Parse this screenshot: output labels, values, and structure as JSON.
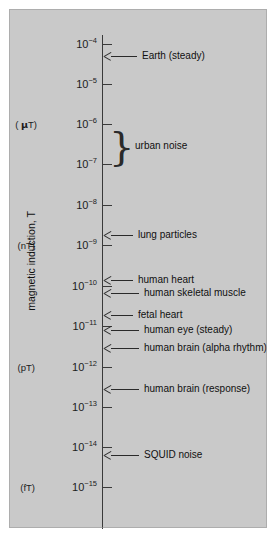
{
  "figure": {
    "background_color": "#c9c9c9",
    "axis_color": "#3a3a3a",
    "text_color": "#101010",
    "y_axis_title": "magnetic induction, T"
  },
  "chart_data": {
    "type": "scatter",
    "title": "",
    "xlabel": "",
    "ylabel": "magnetic induction, T",
    "scale": "log",
    "ylim": [
      1e-15,
      0.0001
    ],
    "grid": false,
    "legend": "none",
    "tick_labels": [
      {
        "exponent": "-4",
        "mantissa": "10",
        "prefix": "",
        "value": 0.0001,
        "y": 35
      },
      {
        "exponent": "-5",
        "mantissa": "10",
        "prefix": "",
        "value": 1e-05,
        "y": 75
      },
      {
        "exponent": "-6",
        "mantissa": "10",
        "prefix": "( μT)",
        "value": 1e-06,
        "y": 115
      },
      {
        "exponent": "-7",
        "mantissa": "10",
        "prefix": "",
        "value": 1e-07,
        "y": 155
      },
      {
        "exponent": "-8",
        "mantissa": "10",
        "prefix": "",
        "value": 1e-08,
        "y": 196
      },
      {
        "exponent": "-9",
        "mantissa": "10",
        "prefix": "(nT)",
        "value": 1e-09,
        "y": 236
      },
      {
        "exponent": "-10",
        "mantissa": "10",
        "prefix": "",
        "value": 1e-10,
        "y": 277
      },
      {
        "exponent": "-11",
        "mantissa": "10",
        "prefix": "",
        "value": 1e-11,
        "y": 317
      },
      {
        "exponent": "-12",
        "mantissa": "10",
        "prefix": "(pT)",
        "value": 1e-12,
        "y": 358
      },
      {
        "exponent": "-13",
        "mantissa": "10",
        "prefix": "",
        "value": 1e-13,
        "y": 398
      },
      {
        "exponent": "-14",
        "mantissa": "10",
        "prefix": "",
        "value": 1e-14,
        "y": 438
      },
      {
        "exponent": "-15",
        "mantissa": "10",
        "prefix": "(fT)",
        "value": 1e-15,
        "y": 478
      }
    ],
    "annotations": [
      {
        "label": "Earth (steady)",
        "value": 5e-05,
        "y": 48,
        "line_length": 26
      },
      {
        "label": "lung particles",
        "value": 3e-09,
        "y": 227,
        "line_length": 22
      },
      {
        "label": "human heart",
        "value": 1e-10,
        "y": 272,
        "line_length": 22
      },
      {
        "label": "human skeletal muscle",
        "value": 5e-11,
        "y": 285,
        "line_length": 28
      },
      {
        "label": "fetal heart",
        "value": 2e-11,
        "y": 307,
        "line_length": 22
      },
      {
        "label": "human eye (steady)",
        "value": 8e-12,
        "y": 322,
        "line_length": 28
      },
      {
        "label": "human brain (alpha rhythm)",
        "value": 2e-12,
        "y": 340,
        "line_length": 28
      },
      {
        "label": "human brain (response)",
        "value": 2e-13,
        "y": 381,
        "line_length": 28
      },
      {
        "label": "SQUID noise",
        "value": 8e-15,
        "y": 447,
        "line_length": 28
      }
    ],
    "range_annotations": [
      {
        "label": "urban noise",
        "value_min": 1e-07,
        "value_max": 1e-06,
        "y_top": 117,
        "y_bottom": 157
      }
    ]
  }
}
